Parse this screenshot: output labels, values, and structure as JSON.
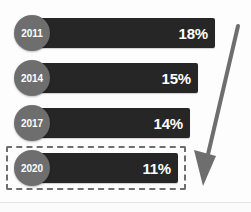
{
  "figure": {
    "background_color": "#fdfdfd",
    "bar_color": "#262626",
    "bubble_color": "#6e6e6e",
    "value_text_color": "#ffffff",
    "highlight_border_color": "#6e6e6e",
    "arrow_color": "#6e6e6e",
    "divider_color": "#e3e3e3"
  },
  "chart_data": {
    "type": "bar",
    "orientation": "horizontal",
    "title": "",
    "subtitle": "",
    "xlabel": "",
    "ylabel": "",
    "categories": [
      "2011",
      "2014",
      "2017",
      "2020"
    ],
    "values": [
      18,
      15,
      14,
      11
    ],
    "value_labels": [
      "18%",
      "15%",
      "14%",
      "11%"
    ],
    "units": "percent",
    "xlim": [
      0,
      20
    ],
    "grid": false,
    "legend": null,
    "highlighted_category": "2020",
    "annotations": [
      {
        "name": "downward-trend-arrow",
        "type": "arrow",
        "direction": "down-left",
        "meaning": "declining trend"
      },
      {
        "name": "highlight-box",
        "type": "dashed-rectangle",
        "target": "2020"
      }
    ]
  },
  "rows": [
    {
      "year": "2011",
      "value_label": "18%",
      "value": 18,
      "bar_width_px": 183,
      "row_top_px": 15,
      "highlighted": false
    },
    {
      "year": "2014",
      "value_label": "15%",
      "value": 15,
      "bar_width_px": 166,
      "row_top_px": 60,
      "highlighted": false
    },
    {
      "year": "2017",
      "value_label": "14%",
      "value": 14,
      "bar_width_px": 158,
      "row_top_px": 105,
      "highlighted": false
    },
    {
      "year": "2020",
      "value_label": "11%",
      "value": 11,
      "bar_width_px": 146,
      "row_top_px": 150,
      "highlighted": true
    }
  ],
  "highlight_box": {
    "left_px": 6,
    "top_px": 146,
    "width_px": 180,
    "height_px": 44
  }
}
